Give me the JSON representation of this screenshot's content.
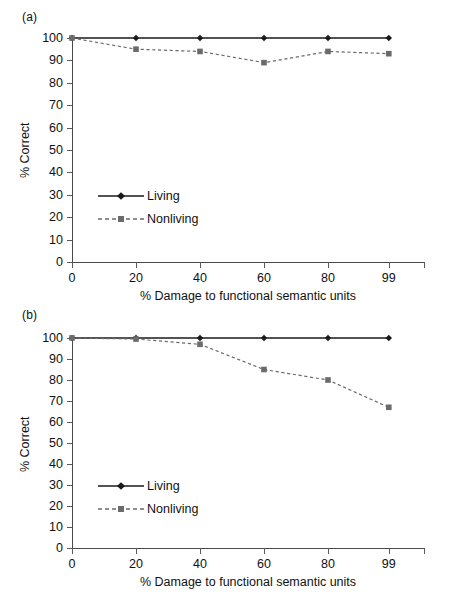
{
  "figure": {
    "panels": [
      {
        "id": "a",
        "label": "(a)",
        "ylabel": "% Correct",
        "xlabel": "% Damage to functional semantic units",
        "ytick_labels": [
          "0",
          "10",
          "20",
          "30",
          "40",
          "50",
          "60",
          "70",
          "80",
          "90",
          "100"
        ],
        "xtick_labels": [
          "0",
          "20",
          "40",
          "60",
          "80",
          "99"
        ],
        "legend": [
          {
            "label": "Living",
            "style": "solid",
            "marker": "diamond",
            "color": "#1a1a1a"
          },
          {
            "label": "Nonliving",
            "style": "dashed",
            "marker": "square",
            "color": "#6b6b6b"
          }
        ]
      },
      {
        "id": "b",
        "label": "(b)",
        "ylabel": "% Correct",
        "xlabel": "% Damage to functional semantic units",
        "ytick_labels": [
          "0",
          "10",
          "20",
          "30",
          "40",
          "50",
          "60",
          "70",
          "80",
          "90",
          "100"
        ],
        "xtick_labels": [
          "0",
          "20",
          "40",
          "60",
          "80",
          "99"
        ],
        "legend": [
          {
            "label": "Living",
            "style": "solid",
            "marker": "diamond",
            "color": "#1a1a1a"
          },
          {
            "label": "Nonliving",
            "style": "dashed",
            "marker": "square",
            "color": "#6b6b6b"
          }
        ]
      }
    ]
  },
  "chart_data": [
    {
      "type": "line",
      "panel": "(a)",
      "title": "",
      "xlabel": "% Damage to functional semantic units",
      "ylabel": "% Correct",
      "categories": [
        "0",
        "20",
        "40",
        "60",
        "80",
        "99"
      ],
      "x": [
        0,
        20,
        40,
        60,
        80,
        99
      ],
      "ylim": [
        0,
        100
      ],
      "yticks": [
        0,
        10,
        20,
        30,
        40,
        50,
        60,
        70,
        80,
        90,
        100
      ],
      "grid": false,
      "legend_position": "inside-lower-left",
      "series": [
        {
          "name": "Living",
          "values": [
            100,
            100,
            100,
            100,
            100,
            100
          ],
          "style": "solid",
          "marker": "diamond",
          "color": "#1a1a1a"
        },
        {
          "name": "Nonliving",
          "values": [
            100,
            95,
            94,
            89,
            94,
            93
          ],
          "style": "dashed",
          "marker": "square",
          "color": "#6b6b6b"
        }
      ]
    },
    {
      "type": "line",
      "panel": "(b)",
      "title": "",
      "xlabel": "% Damage to functional semantic units",
      "ylabel": "% Correct",
      "categories": [
        "0",
        "20",
        "40",
        "60",
        "80",
        "99"
      ],
      "x": [
        0,
        20,
        40,
        60,
        80,
        99
      ],
      "ylim": [
        0,
        100
      ],
      "yticks": [
        0,
        10,
        20,
        30,
        40,
        50,
        60,
        70,
        80,
        90,
        100
      ],
      "grid": false,
      "legend_position": "inside-lower-left",
      "series": [
        {
          "name": "Living",
          "values": [
            100,
            100,
            100,
            100,
            100,
            100
          ],
          "style": "solid",
          "marker": "diamond",
          "color": "#1a1a1a"
        },
        {
          "name": "Nonliving",
          "values": [
            100,
            99.5,
            97,
            85,
            80,
            67
          ],
          "style": "dashed",
          "marker": "square",
          "color": "#6b6b6b"
        }
      ]
    }
  ]
}
